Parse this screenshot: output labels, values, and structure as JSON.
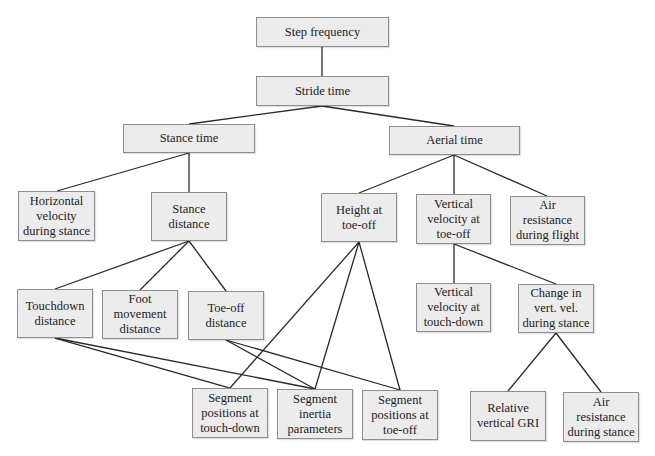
{
  "diagram": {
    "colors": {
      "node_fill": "#ececec",
      "node_border": "#8e8e8e",
      "edge": "#2a2a2a",
      "text": "#222222",
      "background": "#ffffff"
    },
    "nodes": [
      {
        "id": "step_frequency",
        "label": "Step frequency",
        "x": 256,
        "y": 17,
        "w": 133,
        "h": 30
      },
      {
        "id": "stride_time",
        "label": "Stride time",
        "x": 256,
        "y": 76,
        "w": 133,
        "h": 30
      },
      {
        "id": "stance_time",
        "label": "Stance time",
        "x": 123,
        "y": 124,
        "w": 132,
        "h": 29
      },
      {
        "id": "aerial_time",
        "label": "Aerial time",
        "x": 389,
        "y": 126,
        "w": 131,
        "h": 29
      },
      {
        "id": "horizontal_velocity",
        "label": "Horizontal\nvelocity\nduring stance",
        "x": 18,
        "y": 191,
        "w": 77,
        "h": 50
      },
      {
        "id": "stance_distance",
        "label": "Stance\ndistance",
        "x": 151,
        "y": 192,
        "w": 76,
        "h": 49
      },
      {
        "id": "height_toe_off",
        "label": "Height at\ntoe-off",
        "x": 321,
        "y": 193,
        "w": 76,
        "h": 49
      },
      {
        "id": "vert_vel_toe_off",
        "label": "Vertical\nvelocity at\ntoe-off",
        "x": 416,
        "y": 194,
        "w": 75,
        "h": 50
      },
      {
        "id": "air_res_flight",
        "label": "Air\nresistance\nduring flight",
        "x": 510,
        "y": 196,
        "w": 75,
        "h": 49
      },
      {
        "id": "touchdown_distance",
        "label": "Touchdown\ndistance",
        "x": 17,
        "y": 289,
        "w": 76,
        "h": 49
      },
      {
        "id": "foot_movement_distance",
        "label": "Foot\nmovement\ndistance",
        "x": 102,
        "y": 290,
        "w": 76,
        "h": 49
      },
      {
        "id": "toe_off_distance",
        "label": "Toe-off\ndistance",
        "x": 188,
        "y": 291,
        "w": 76,
        "h": 49
      },
      {
        "id": "vert_vel_touchdown",
        "label": "Vertical\nvelocity at\ntouch-down",
        "x": 416,
        "y": 283,
        "w": 75,
        "h": 49
      },
      {
        "id": "change_vert_vel",
        "label": "Change in\nvert. vel.\nduring stance",
        "x": 518,
        "y": 284,
        "w": 76,
        "h": 49
      },
      {
        "id": "seg_pos_touchdown",
        "label": "Segment\npositions at\ntouch-down",
        "x": 192,
        "y": 388,
        "w": 76,
        "h": 50
      },
      {
        "id": "seg_inertia",
        "label": "Segment\ninertia\nparameters",
        "x": 277,
        "y": 389,
        "w": 76,
        "h": 50
      },
      {
        "id": "seg_pos_toe_off",
        "label": "Segment\npositions at\ntoe-off",
        "x": 362,
        "y": 390,
        "w": 76,
        "h": 50
      },
      {
        "id": "relative_vertical_gri",
        "label": "Relative\nvertical GRI",
        "x": 470,
        "y": 391,
        "w": 76,
        "h": 50
      },
      {
        "id": "air_res_stance",
        "label": "Air resistance\nduring stance",
        "x": 563,
        "y": 392,
        "w": 76,
        "h": 50
      }
    ],
    "edges": [
      {
        "from": "step_frequency",
        "to": "stride_time",
        "x1": 322,
        "y1": 47,
        "x2": 322,
        "y2": 76
      },
      {
        "from": "stride_time",
        "to": "stance_time",
        "x1": 322,
        "y1": 106,
        "x2": 189,
        "y2": 124
      },
      {
        "from": "stride_time",
        "to": "aerial_time",
        "x1": 322,
        "y1": 106,
        "x2": 454,
        "y2": 126
      },
      {
        "from": "stance_time",
        "to": "horizontal_velocity",
        "x1": 189,
        "y1": 153,
        "x2": 57,
        "y2": 191
      },
      {
        "from": "stance_time",
        "to": "stance_distance",
        "x1": 189,
        "y1": 153,
        "x2": 189,
        "y2": 192
      },
      {
        "from": "aerial_time",
        "to": "height_toe_off",
        "x1": 454,
        "y1": 155,
        "x2": 359,
        "y2": 193
      },
      {
        "from": "aerial_time",
        "to": "vert_vel_toe_off",
        "x1": 454,
        "y1": 155,
        "x2": 454,
        "y2": 194
      },
      {
        "from": "aerial_time",
        "to": "air_res_flight",
        "x1": 454,
        "y1": 155,
        "x2": 547,
        "y2": 196
      },
      {
        "from": "stance_distance",
        "to": "touchdown_distance",
        "x1": 189,
        "y1": 241,
        "x2": 55,
        "y2": 289
      },
      {
        "from": "stance_distance",
        "to": "foot_movement_distance",
        "x1": 189,
        "y1": 241,
        "x2": 140,
        "y2": 290
      },
      {
        "from": "stance_distance",
        "to": "toe_off_distance",
        "x1": 189,
        "y1": 241,
        "x2": 226,
        "y2": 291
      },
      {
        "from": "vert_vel_toe_off",
        "to": "vert_vel_touchdown",
        "x1": 454,
        "y1": 244,
        "x2": 454,
        "y2": 283
      },
      {
        "from": "vert_vel_toe_off",
        "to": "change_vert_vel",
        "x1": 454,
        "y1": 244,
        "x2": 556,
        "y2": 284
      },
      {
        "from": "change_vert_vel",
        "to": "relative_vertical_gri",
        "x1": 556,
        "y1": 333,
        "x2": 508,
        "y2": 391
      },
      {
        "from": "change_vert_vel",
        "to": "air_res_stance",
        "x1": 556,
        "y1": 333,
        "x2": 601,
        "y2": 392
      },
      {
        "from": "touchdown_distance",
        "to": "seg_pos_touchdown",
        "x1": 55,
        "y1": 338,
        "x2": 230,
        "y2": 388
      },
      {
        "from": "touchdown_distance",
        "to": "seg_inertia",
        "x1": 55,
        "y1": 338,
        "x2": 315,
        "y2": 389
      },
      {
        "from": "toe_off_distance",
        "to": "seg_inertia",
        "x1": 226,
        "y1": 340,
        "x2": 315,
        "y2": 389
      },
      {
        "from": "toe_off_distance",
        "to": "seg_pos_toe_off",
        "x1": 226,
        "y1": 340,
        "x2": 400,
        "y2": 390
      },
      {
        "from": "height_toe_off",
        "to": "seg_pos_touchdown",
        "x1": 359,
        "y1": 242,
        "x2": 230,
        "y2": 388
      },
      {
        "from": "height_toe_off",
        "to": "seg_inertia",
        "x1": 359,
        "y1": 242,
        "x2": 315,
        "y2": 389
      },
      {
        "from": "height_toe_off",
        "to": "seg_pos_toe_off",
        "x1": 359,
        "y1": 242,
        "x2": 400,
        "y2": 390
      }
    ]
  }
}
